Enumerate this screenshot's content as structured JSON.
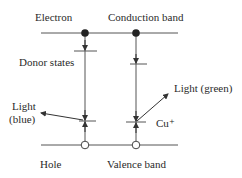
{
  "diagram": {
    "type": "energy-band-diagram",
    "labels": {
      "electron": "Electron",
      "conduction_band": "Conduction band",
      "donor_states": "Donor states",
      "light_green": "Light (green)",
      "light_blue_line1": "Light",
      "light_blue_line2": "(blue)",
      "cu_plus": "Cu⁺",
      "hole": "Hole",
      "valence_band": "Valence band"
    },
    "colors": {
      "line": "#555555",
      "dot": "#222222",
      "text": "#2a2a2a"
    },
    "elements": {
      "conduction_band_line": {
        "x1": 41,
        "x2": 178,
        "y": 33
      },
      "valence_band_line": {
        "x1": 41,
        "x2": 178,
        "y": 145
      },
      "electrons": [
        {
          "x": 85,
          "y": 33
        },
        {
          "x": 136,
          "y": 33
        }
      ],
      "holes": [
        {
          "x": 85,
          "y": 145
        },
        {
          "x": 136,
          "y": 145
        }
      ],
      "donor_level": {
        "x1": 74,
        "x2": 97,
        "y": 51
      },
      "right_upper_level": {
        "x1": 130,
        "x2": 147,
        "y": 64
      },
      "blue_level": {
        "x1": 79,
        "x2": 96,
        "y": 121
      },
      "cu_level": {
        "x1": 126,
        "x2": 146,
        "y": 122
      }
    }
  }
}
